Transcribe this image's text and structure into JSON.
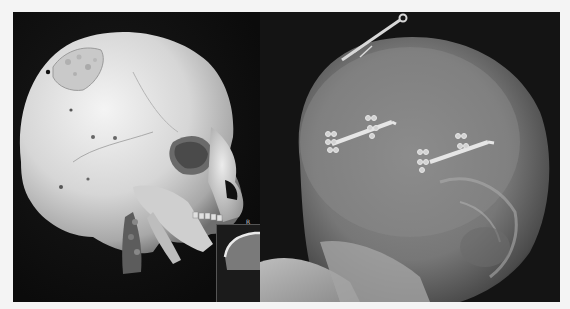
{
  "figure": {
    "panels": [
      {
        "id": "left",
        "content": "3D CT volume rendering of skull, lateral oblique view, with cranial bone defects"
      },
      {
        "id": "right",
        "content": "Lateral skull X-ray showing metallic fixation plates and screws"
      }
    ],
    "inset": {
      "label": "R",
      "content": "Small CT slice inset"
    },
    "colors": {
      "background": "#f4f4f4",
      "panel_bg": "#0e0e0e",
      "bone": "#e4e4e4",
      "xray_bg": "#141414"
    }
  }
}
